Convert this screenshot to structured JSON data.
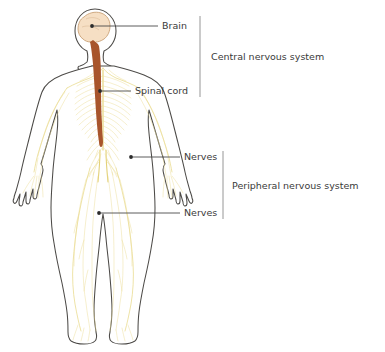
{
  "diagram": {
    "labels": [
      {
        "id": "brain",
        "text": "Brain",
        "anchor_x": 91,
        "anchor_y": 26,
        "text_x": 162,
        "text_y": 26
      },
      {
        "id": "spinal-cord",
        "text": "Spinal cord",
        "anchor_x": 90,
        "anchor_y": 91,
        "text_x": 135,
        "text_y": 91
      },
      {
        "id": "nerves-arm",
        "text": "Nerves",
        "anchor_x": 131,
        "anchor_y": 157,
        "text_x": 184,
        "text_y": 157
      },
      {
        "id": "nerves-leg",
        "text": "Nerves",
        "anchor_x": 99,
        "anchor_y": 213,
        "text_x": 184,
        "text_y": 213
      }
    ],
    "groups": [
      {
        "id": "central-nervous-system",
        "text": "Central nervous system",
        "bracket_x": 200,
        "bracket_top": 16,
        "bracket_bottom": 97,
        "text_x": 211,
        "text_y": 57
      },
      {
        "id": "peripheral-nervous-system",
        "text": "Peripheral nervous system",
        "bracket_x": 223,
        "bracket_top": 151,
        "bracket_bottom": 219,
        "text_x": 232,
        "text_y": 186
      }
    ],
    "colors": {
      "background": "#ffffff",
      "body_outline": "#4c4a47",
      "nerve": "#e8d98a",
      "brain_fill": "#f6dfc4",
      "brain_stroke": "#caa277",
      "spinal_cord": "#a8552c",
      "label_text": "#3a3a3a",
      "leader_line": "#4a4a4a",
      "bracket_line": "#8a8a8a"
    }
  }
}
